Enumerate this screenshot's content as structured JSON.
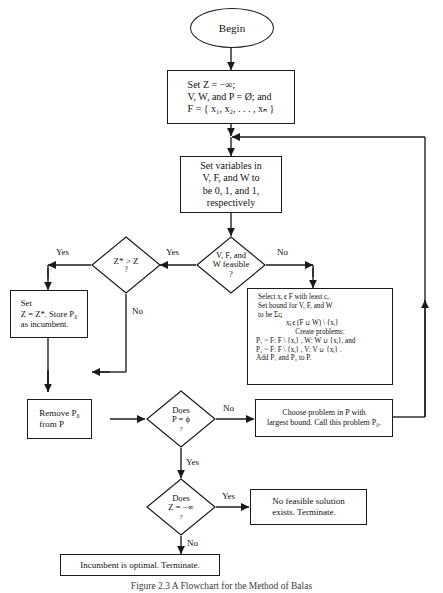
{
  "figure": {
    "caption": "Figure 2.3  A Flowchart for the Method of Balas",
    "type": "flowchart"
  },
  "nodes": {
    "begin": {
      "label": "Begin",
      "shape": "ellipse"
    },
    "init": {
      "shape": "process",
      "lines": [
        "Set Z = −∞;",
        "V, W, and P = Ø; and",
        "F = { x₁, x₂, . . . , xₙ }"
      ]
    },
    "set_variables": {
      "shape": "process",
      "lines": [
        "Set variables in",
        "V, F, and W to",
        "be 0, 1, and 1,",
        "respectively"
      ]
    },
    "feasible_test": {
      "shape": "decision",
      "lines": [
        "V, F, and",
        "W feasible",
        "?"
      ]
    },
    "zstar_test": {
      "shape": "decision",
      "lines": [
        "Z* > Z",
        "?"
      ]
    },
    "store_incumbent": {
      "shape": "process",
      "lines": [
        "Set",
        "Z = Z*.  Store P₀",
        "as incumbent."
      ]
    },
    "branch_box": {
      "shape": "process",
      "lines": [
        "Select xᵢ ϵ F with least cᵢ.",
        "Set bound for V, F, and W",
        "to be            Σcⱼ",
        "xⱼ ϵ (F ∪ W) \\ {xᵢ}",
        "Create problems:",
        "P₁ ~ F: F \\ {xᵢ} ,  W: W ∪ {xᵢ}, and",
        "P₂ ~ F: F \\ {xᵢ} ,  V: V ∪ {xᵢ} .",
        "Add P₁ and P₂ to P."
      ]
    },
    "remove_p0": {
      "shape": "process",
      "lines": [
        "Remove  P₀",
        "from P"
      ]
    },
    "p_empty_test": {
      "shape": "decision",
      "lines": [
        "Does",
        "P = ϕ",
        "?"
      ]
    },
    "choose_problem": {
      "shape": "process",
      "lines": [
        "Choose problem in P with",
        "largest bound.  Call this problem  P₀."
      ]
    },
    "z_neg_inf_test": {
      "shape": "decision",
      "lines": [
        "Does",
        "Z = −∞",
        "?"
      ]
    },
    "no_feasible": {
      "shape": "process",
      "lines": [
        "No feasible solution",
        "exists.  Terminate."
      ]
    },
    "incumbent_optimal": {
      "shape": "process",
      "lines": [
        "Incumbent is optimal.  Terminate."
      ]
    }
  },
  "edge_labels": {
    "feasible_yes": "Yes",
    "feasible_no": "No",
    "zstar_yes": "Yes",
    "zstar_no": "No",
    "p_empty_no": "No",
    "p_empty_yes": "Yes",
    "z_neg_yes": "Yes",
    "z_neg_no": "No"
  },
  "style": {
    "line_color": "#1a1a1a",
    "background": "#ffffff",
    "text_color": "#111111"
  }
}
